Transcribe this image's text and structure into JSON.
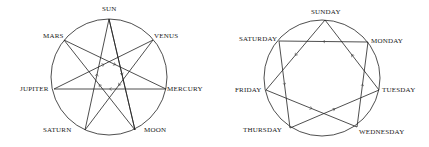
{
  "left_diagram": {
    "labels": {
      "sun": "SUN",
      "venus": "VENUS",
      "mercury": "MERCURY",
      "moon": "MOON",
      "saturn": "SATURN",
      "jupiter": "JUPITER",
      "mars": "MARS"
    }
  },
  "right_diagram": {
    "labels": {
      "sunday": "SUNDAY",
      "monday": "MONDAY",
      "tuesday": "TUESDAY",
      "wednesday": "WEDNESDAY",
      "thursday": "THURSDAY",
      "friday": "FRIDAY",
      "saturday": "SATURDAY"
    }
  },
  "colors": {
    "line": "#222222",
    "background": "#ffffff"
  }
}
